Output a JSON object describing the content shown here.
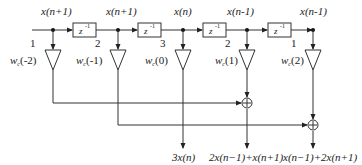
{
  "diagram": {
    "type": "FIR filter / tapped delay line signal flow diagram",
    "taps": [
      {
        "top_label": "x(n+1)",
        "index_label": "1",
        "coeff_label": "w",
        "coeff_sub": "c",
        "coeff_arg": "(-2)"
      },
      {
        "top_label": "x(n+1)",
        "index_label": "2",
        "coeff_label": "w",
        "coeff_sub": "c",
        "coeff_arg": "(-1)"
      },
      {
        "top_label": "x(n)",
        "index_label": "3",
        "coeff_label": "w",
        "coeff_sub": "c",
        "coeff_arg": "(0)"
      },
      {
        "top_label": "x(n-1)",
        "index_label": "2",
        "coeff_label": "w",
        "coeff_sub": "c",
        "coeff_arg": "(1)"
      },
      {
        "top_label": "x(n-1)",
        "index_label": "1",
        "coeff_label": "w",
        "coeff_sub": "c",
        "coeff_arg": "(2)"
      }
    ],
    "delays": [
      {
        "label": "z",
        "exp": "-1"
      },
      {
        "label": "z",
        "exp": "-1"
      },
      {
        "label": "z",
        "exp": "-1"
      },
      {
        "label": "z",
        "exp": "-1"
      }
    ],
    "adders": [
      {
        "symbol": "+"
      },
      {
        "symbol": "+"
      }
    ],
    "outputs": [
      {
        "label": "3x(n)"
      },
      {
        "label": "2x(n−1)+x(n+1)"
      },
      {
        "label": "x(n−1)+2x(n+1)"
      }
    ]
  }
}
